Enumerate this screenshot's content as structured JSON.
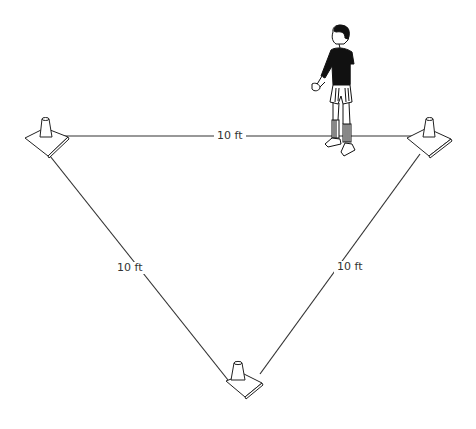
{
  "diagram": {
    "type": "triangle-cone-drill",
    "colors": {
      "line": "#333333",
      "background": "#ffffff",
      "figure": "#111111"
    },
    "cones": [
      {
        "name": "top-left-cone",
        "x": 45,
        "y": 140
      },
      {
        "name": "top-right-cone",
        "x": 430,
        "y": 140
      },
      {
        "name": "bottom-cone",
        "x": 237,
        "y": 388
      }
    ],
    "edges": [
      {
        "name": "top-edge",
        "label": "10 ft"
      },
      {
        "name": "left-edge",
        "label": "10 ft"
      },
      {
        "name": "right-edge",
        "label": "10 ft"
      }
    ],
    "figure": {
      "name": "player",
      "description": "standing player near top-right cone"
    }
  }
}
